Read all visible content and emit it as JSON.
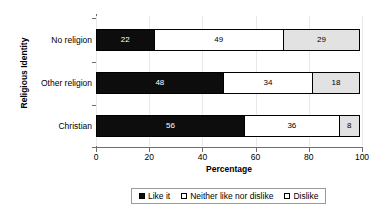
{
  "chart_data": {
    "type": "bar",
    "orientation": "horizontal",
    "stacked": true,
    "stack_mode": "percent",
    "title": "",
    "xlabel": "Percentage",
    "ylabel": "Religious Identity",
    "xlim": [
      0,
      100
    ],
    "xticks": [
      0,
      20,
      40,
      60,
      80,
      100
    ],
    "xtick_labels": [
      "0",
      "20",
      "40",
      "60",
      "80",
      "100"
    ],
    "grid": true,
    "grid_axis": "x",
    "legend_position": "bottom",
    "categories": [
      "No religion",
      "Other religion",
      "Christian"
    ],
    "category_order_top_to_bottom": [
      "No religion",
      "Other religion",
      "Christian"
    ],
    "series": [
      {
        "name": "Like it",
        "color": "#0d0d0d",
        "label_color": "#ffffff",
        "values": [
          22,
          48,
          56
        ]
      },
      {
        "name": "Neither like nor dislike",
        "color": "#ffffff",
        "label_color": "#000000",
        "values": [
          49,
          34,
          36
        ]
      },
      {
        "name": "Dislike",
        "color": "#e2e2e2",
        "label_color": "#000000",
        "values": [
          29,
          18,
          8
        ]
      }
    ],
    "rows": [
      {
        "category": "No religion",
        "segments": [
          {
            "series": "Like it",
            "value": 22,
            "data_label": "22"
          },
          {
            "series": "Neither like nor dislike",
            "value": 49,
            "data_label": "49"
          },
          {
            "series": "Dislike",
            "value": 29,
            "data_label": "29"
          }
        ]
      },
      {
        "category": "Other religion",
        "segments": [
          {
            "series": "Like it",
            "value": 48,
            "data_label": "48"
          },
          {
            "series": "Neither like nor dislike",
            "value": 34,
            "data_label": "34"
          },
          {
            "series": "Dislike",
            "value": 18,
            "data_label": "18"
          }
        ]
      },
      {
        "category": "Christian",
        "segments": [
          {
            "series": "Like it",
            "value": 56,
            "data_label": "56"
          },
          {
            "series": "Neither like nor dislike",
            "value": 36,
            "data_label": "36"
          },
          {
            "series": "Dislike",
            "value": 8,
            "data_label": "8"
          }
        ]
      }
    ]
  },
  "axes": {
    "y_title": "Religious Identity",
    "x_title": "Percentage",
    "category_labels": [
      "No religion",
      "Other religion",
      "Christian"
    ],
    "x_tick_labels": [
      "0",
      "20",
      "40",
      "60",
      "80",
      "100"
    ]
  },
  "legend": {
    "items": [
      {
        "label": "Like it",
        "swatch": "#0d0d0d"
      },
      {
        "label": "Neither like nor dislike",
        "swatch": "#ffffff"
      },
      {
        "label": "Dislike",
        "swatch": "#ffffff"
      }
    ]
  },
  "colors": {
    "like": "#0d0d0d",
    "neither": "#ffffff",
    "dislike": "#e2e2e2",
    "axis": "#6e6e6e",
    "gridline": "#e8e8e8",
    "legend_border": "#9a9a9a",
    "text": "#000000",
    "background": "#ffffff"
  }
}
